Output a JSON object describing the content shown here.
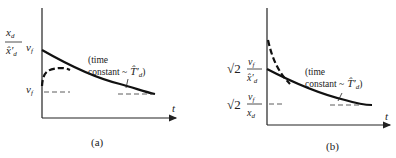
{
  "panel_a": {
    "label": "(a)",
    "y_upper_num": "x",
    "y_upper_num_sub": "d",
    "y_upper_den": "x̂′",
    "y_upper_den_sub": "d",
    "y_upper_mult": "v",
    "y_upper_mult_sub": "f",
    "y_lower": "v",
    "y_lower_sub": "f",
    "annotation_line1": "(time",
    "annotation_line2": "constant ~",
    "annotation_symbol": "T̂′",
    "annotation_symbol_sub": "d",
    "annotation_close": ")",
    "x_axis_label": "t"
  },
  "panel_b": {
    "label": "(b)",
    "y_upper_sqrt": "√2",
    "y_upper_num": "v",
    "y_upper_num_sub": "f",
    "y_upper_den": "x̂′",
    "y_upper_den_sub": "d",
    "y_lower_sqrt": "√2",
    "y_lower_num": "v",
    "y_lower_num_sub": "f",
    "y_lower_den": "x",
    "y_lower_den_sub": "d",
    "annotation_line1": "(time",
    "annotation_line2": "constant ~",
    "annotation_symbol": "T̂′",
    "annotation_symbol_sub": "d",
    "annotation_close": ")",
    "x_axis_label": "t"
  }
}
